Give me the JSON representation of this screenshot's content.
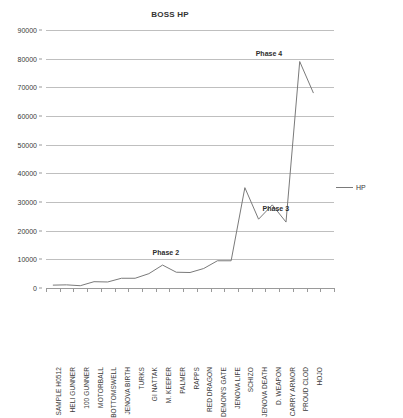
{
  "chart_data": {
    "type": "line",
    "title": "BOSS HP",
    "xlabel": "",
    "ylabel": "",
    "ylim": [
      0,
      90000
    ],
    "ytick_step": 10000,
    "yticks": [
      0,
      10000,
      20000,
      30000,
      40000,
      50000,
      60000,
      70000,
      80000,
      90000
    ],
    "ytick_labels": [
      "0",
      "10000",
      "20000",
      "30000",
      "40000",
      "50000",
      "60000",
      "70000",
      "80000",
      "90000"
    ],
    "grid": true,
    "legend_position": "right",
    "line_color": "#7a7a7a",
    "categories": [
      "SAMPLE H0512",
      "HELI GUNNER",
      "100 GUNNER",
      "MOTORBALL",
      "BOTTOMSWELL",
      "JENOVA BIRTH",
      "TURKS",
      "GI NATTAK",
      "M. KEEPER",
      "PALMER",
      "RAPPS",
      "RED DRAGON",
      "DEMON'S GATE",
      "JENOVA LIFE",
      "SCHIZO",
      "JENOVA DEATH",
      "D. WEAPON",
      "CARRY ARMOR",
      "PROUD CLOD",
      "HOJO"
    ],
    "series": [
      {
        "name": "HP",
        "values": [
          1000,
          1100,
          800,
          2200,
          2100,
          3400,
          3400,
          5000,
          8000,
          5500,
          5400,
          6800,
          9500,
          9500,
          35000,
          24000,
          29000,
          23000,
          79000,
          68000
        ]
      }
    ],
    "annotations": [
      {
        "text": "Phase 2",
        "near_category": "M. KEEPER"
      },
      {
        "text": "Phase 3",
        "near_category": "JENOVA DEATH"
      },
      {
        "text": "Phase 4",
        "near_category": "PROUD CLOD"
      }
    ]
  },
  "legend": {
    "entries": [
      {
        "label": "HP",
        "color": "#7a7a7a",
        "icon": "line-swatch"
      }
    ]
  }
}
